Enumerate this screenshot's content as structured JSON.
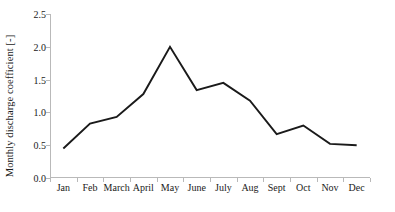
{
  "chart_data": {
    "type": "line",
    "title": "",
    "subtitle": "",
    "xlabel": "",
    "ylabel": "Monthly discharge coefficient [-]",
    "categories": [
      "Jan",
      "Feb",
      "March",
      "April",
      "May",
      "June",
      "July",
      "Aug",
      "Sept",
      "Oct",
      "Nov",
      "Dec"
    ],
    "values": [
      0.45,
      0.83,
      0.93,
      1.28,
      2.0,
      1.34,
      1.45,
      1.18,
      0.67,
      0.8,
      0.52,
      0.5
    ],
    "series": [
      {
        "name": "Monthly discharge coefficient",
        "values": [
          0.45,
          0.83,
          0.93,
          1.28,
          2.0,
          1.34,
          1.45,
          1.18,
          0.67,
          0.8,
          0.52,
          0.5
        ]
      }
    ],
    "ylim": [
      0.0,
      2.5
    ],
    "ytick_labels": [
      "0.0",
      "0.5",
      "1.0",
      "1.5",
      "2.0",
      "2.5"
    ],
    "ytick_values": [
      0.0,
      0.5,
      1.0,
      1.5,
      2.0,
      2.5
    ],
    "grid": false,
    "legend": false,
    "legend_position": "none",
    "line_color": "#1a1a1a",
    "axis_color": "#b9b9b9",
    "background_color": "#ffffff",
    "annotations": []
  }
}
